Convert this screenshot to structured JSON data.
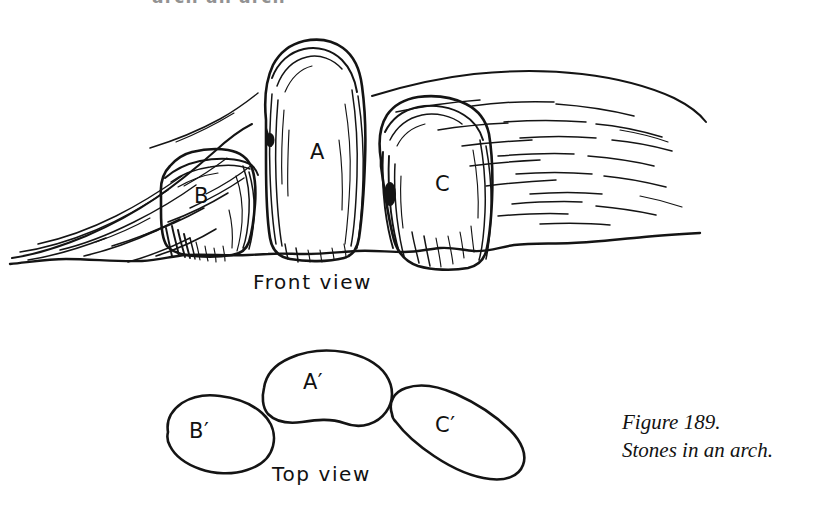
{
  "figure": {
    "cropped_heading": "arch  an arch",
    "front_view": {
      "label": "Front  view",
      "stones": [
        {
          "id": "B",
          "letter": "B"
        },
        {
          "id": "A",
          "letter": "A"
        },
        {
          "id": "C",
          "letter": "C"
        }
      ]
    },
    "top_view": {
      "label": "Top  view",
      "stones": [
        {
          "id": "B-prime",
          "letter": "B′"
        },
        {
          "id": "A-prime",
          "letter": "A′"
        },
        {
          "id": "C-prime",
          "letter": "C′"
        }
      ]
    },
    "caption": {
      "number": "Figure 189.",
      "title": "Stones in an arch."
    },
    "colors": {
      "background": "#ffffff",
      "ink": "#141414",
      "text": "#111111"
    }
  }
}
